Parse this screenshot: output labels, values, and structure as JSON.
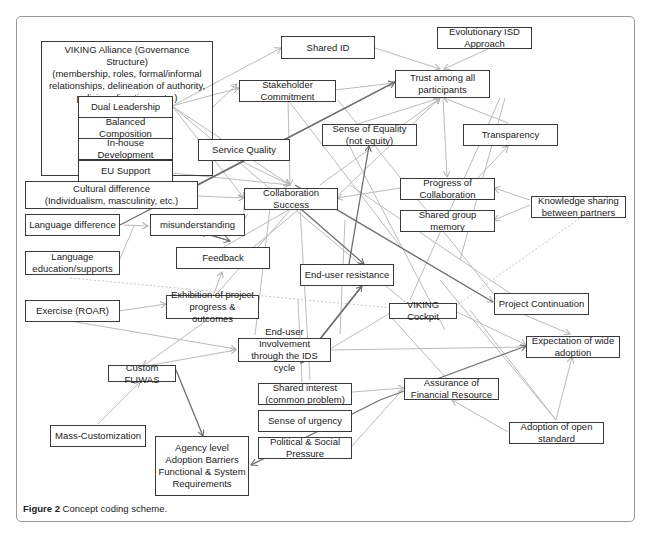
{
  "caption": {
    "label": "Figure 2",
    "text": "Concept coding scheme."
  },
  "nodes": {
    "viking_alliance": "VIKING Alliance (Governance  Structure)\n(membership, roles, formal/informal\nrelationships, delineation of authority,\npolicies, directives, etc.)",
    "dual_leadership": "Dual Leadership",
    "balanced_composition": "Balanced\nComposition",
    "inhouse_development": "In-house\nDevelopment",
    "eu_support": "EU Support",
    "cultural_difference": "Cultural difference\n(Individualism, masculinity, etc.)",
    "language_difference": "Language difference",
    "language_education": "Language\neducation/supports",
    "exercise_roar": "Exercise (ROAR)",
    "custom_fliwas": "Custom FLIWAS",
    "mass_customization": "Mass-Customization",
    "agency_level": "Agency level\nAdoption Barriers\nFunctional & System\nRequirements",
    "shared_id": "Shared ID",
    "stakeholder_commitment": "Stakeholder\nCommitment",
    "service_quality": "Service Quality",
    "collaboration_success": "Collaboration Success",
    "misunderstanding": "misunderstanding",
    "feedback": "Feedback",
    "exhibition": "Exhibition of project\nprogress & outcomes",
    "end_user_involvement": "End-user Involvement\nthrough the IDS cycle",
    "end_user_resistance": "End-user resistance",
    "shared_interest": "Shared interest\n(common problem)",
    "sense_of_urgency": "Sense of urgency",
    "political_social": "Political & Social\nPressure",
    "evolutionary_isd": "Evolutionary ISD\nApproach",
    "trust": "Trust among all\nparticipants",
    "sense_of_equality": "Sense of Equality\n(not equity)",
    "transparency": "Transparency",
    "progress_collaboration": "Progress of\nCollaboration",
    "shared_group_memory": "Shared group\nmemory",
    "knowledge_sharing": "Knowledge sharing\nbetween partners",
    "viking_cockpit": "VIKING Cockpit",
    "project_continuation": "Project Continuation",
    "expectation_wide_adoption": "Expectation of wide\nadoption",
    "assurance_financial": "Assurance of\nFinancial Resource",
    "adoption_open_standard": "Adoption of open\nstandard"
  },
  "colors": {
    "edge_light": "#b8b8b8",
    "edge_dark": "#6a6a6a",
    "node_border": "#3a3a3a",
    "frame_border": "#9a9a9a"
  }
}
